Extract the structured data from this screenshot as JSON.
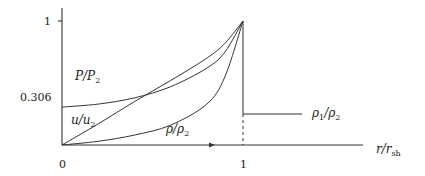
{
  "chart_data": {
    "type": "line",
    "title": "",
    "xlabel": "r/r_sh",
    "ylabel": "",
    "xlim": [
      0,
      1.6
    ],
    "ylim": [
      0,
      1.1
    ],
    "x_ticks": [
      {
        "value": 0,
        "label": "0"
      },
      {
        "value": 1,
        "label": "1"
      }
    ],
    "y_ticks": [
      {
        "value": 0.306,
        "label": "0.306"
      },
      {
        "value": 1,
        "label": "1"
      }
    ],
    "grid": false,
    "series": [
      {
        "name": "P/P2",
        "x": [
          0,
          0.2,
          0.4,
          0.6,
          0.8,
          0.9,
          1.0
        ],
        "y": [
          0.306,
          0.33,
          0.38,
          0.47,
          0.62,
          0.75,
          1.0
        ]
      },
      {
        "name": "u/u2",
        "x": [
          0,
          0.2,
          0.4,
          0.6,
          0.8,
          0.9,
          1.0
        ],
        "y": [
          0,
          0.17,
          0.35,
          0.52,
          0.7,
          0.82,
          1.0
        ]
      },
      {
        "name": "rho/rho2",
        "x": [
          0,
          0.2,
          0.4,
          0.6,
          0.8,
          0.9,
          1.0
        ],
        "y": [
          0,
          0.03,
          0.08,
          0.16,
          0.33,
          0.55,
          1.0
        ]
      },
      {
        "name": "rho1/rho2",
        "x": [
          1.0,
          1.42
        ],
        "y": [
          0.25,
          0.25
        ]
      }
    ],
    "annotations": [
      {
        "text": "P/P₂",
        "target": "P/P2"
      },
      {
        "text": "u/u₂",
        "target": "u/u2"
      },
      {
        "text": "ρ/ρ₂",
        "target": "rho/rho2"
      },
      {
        "text": "ρ₁/ρ₂",
        "target": "rho1/rho2"
      },
      {
        "text": "shock position dashed line at r/r_sh = 1"
      }
    ]
  },
  "labels": {
    "y_one": "1",
    "y_0306": "0.306",
    "x_zero": "0",
    "x_one": "1",
    "P_main": "P/P",
    "P_sub": "2",
    "u_main": "u/u",
    "u_sub": "2",
    "rho_main": "ρ/ρ",
    "rho_sub": "2",
    "rho1_a": "ρ",
    "rho1_sub1": "1",
    "rho1_b": "/ρ",
    "rho1_sub2": "2",
    "xlabel_main": "r/r",
    "xlabel_sub": "sh"
  }
}
